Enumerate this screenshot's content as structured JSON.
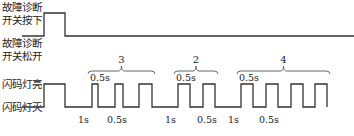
{
  "colors": {
    "stroke": "#333333",
    "text": "#222222",
    "background": "#ffffff"
  },
  "labels": {
    "switch_pressed": [
      "故障诊断",
      "开关按下"
    ],
    "switch_released": [
      "故障诊断",
      "开关松开"
    ],
    "lamp_on": "闪码灯亮",
    "lamp_off": "闪码灯灭"
  },
  "switch_wave": {
    "high_y": 13,
    "low_y": 36,
    "points": [
      [
        64,
        36
      ],
      [
        44,
        36
      ],
      [
        44,
        13
      ],
      [
        65,
        13
      ],
      [
        65,
        36
      ],
      [
        354,
        36
      ]
    ]
  },
  "lamp_wave": {
    "high_y": 84,
    "low_y": 107,
    "edges": [
      [
        65,
        107
      ],
      [
        44,
        107
      ]
    ],
    "pulses": [
      [
        44,
        65
      ],
      [
        92,
        98
      ],
      [
        115,
        123
      ],
      [
        139,
        152
      ],
      [
        178,
        190
      ],
      [
        203,
        215
      ],
      [
        241,
        253
      ],
      [
        266,
        278
      ],
      [
        291,
        303
      ],
      [
        315,
        327
      ]
    ],
    "start_x": 22,
    "end_x": 327
  },
  "groups": [
    {
      "count": "3",
      "x1": 88,
      "x2": 155,
      "sub_label": "0.5s"
    },
    {
      "count": "2",
      "x1": 174,
      "x2": 218,
      "sub_label": "0.5s"
    },
    {
      "count": "4",
      "x1": 237,
      "x2": 330,
      "sub_label": "0.5s"
    }
  ],
  "timing_labels": [
    {
      "text": "1s",
      "x": 78
    },
    {
      "text": "0.5s",
      "x": 107
    },
    {
      "text": "1s",
      "x": 165
    },
    {
      "text": "0.5s",
      "x": 197
    },
    {
      "text": "1s",
      "x": 228
    },
    {
      "text": "0.5s",
      "x": 259
    }
  ]
}
